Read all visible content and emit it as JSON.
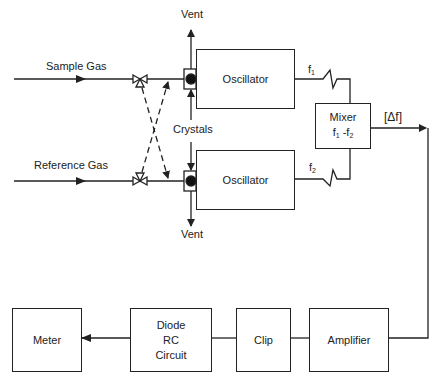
{
  "diagram": {
    "inputs": {
      "sample_gas": "Sample Gas",
      "reference_gas": "Reference Gas"
    },
    "vent_top": "Vent",
    "vent_bottom": "Vent",
    "crystals": "Crystals",
    "oscillator_1": "Oscillator",
    "oscillator_2": "Oscillator",
    "f1": "f",
    "f1_sub": "1",
    "f2": "f",
    "f2_sub": "2",
    "mixer": {
      "title": "Mixer",
      "formula_a": "f",
      "formula_a_sub": "1",
      "formula_sep": " -",
      "formula_b": "f",
      "formula_b_sub": "2"
    },
    "delta_f": "[Δf]",
    "amplifier": "Amplifier",
    "clip": "Clip",
    "diode_rc": [
      "Diode",
      "RC",
      "Circuit"
    ],
    "meter": "Meter",
    "line_color": "#222222"
  }
}
